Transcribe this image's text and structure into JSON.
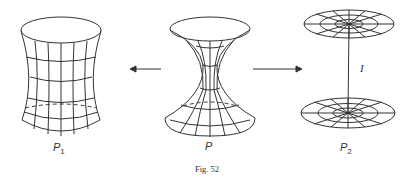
{
  "figure": {
    "caption": "Fig. 52",
    "surfaces": [
      {
        "id": "P1",
        "label": "P",
        "subscript": "1",
        "description": "one-sheeted hyperboloid-like surface (slightly pinched cylinder)"
      },
      {
        "id": "P",
        "label": "P",
        "subscript": "",
        "description": "pinched hourglass surface"
      },
      {
        "id": "P2",
        "label": "P",
        "subscript": "2",
        "description": "two discs joined by a segment"
      }
    ],
    "segment_label": "I",
    "arrows": [
      {
        "from": "P",
        "to": "P1",
        "direction": "left"
      },
      {
        "from": "P",
        "to": "P2",
        "direction": "right"
      }
    ],
    "colors": {
      "stroke": "#333333",
      "background": "#ffffff"
    }
  }
}
